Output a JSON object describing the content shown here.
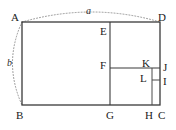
{
  "figure": {
    "canvas": {
      "width": 176,
      "height": 130
    },
    "colors": {
      "solid_stroke": "#3a3a3a",
      "inner_stroke": "#4a4a4a",
      "dotted_stroke": "#8a8a8a",
      "label_text": "#1a1a1a",
      "dimension_text": "#2b2b2b",
      "background": "#ffffff"
    },
    "outer_rectangle": {
      "name": "ABCD",
      "corners": {
        "A": [
          22,
          22
        ],
        "B": [
          22,
          105
        ],
        "C": [
          160,
          105
        ],
        "D": [
          160,
          22
        ]
      }
    },
    "points": {
      "A": [
        22,
        22
      ],
      "B": [
        22,
        105
      ],
      "C": [
        160,
        105
      ],
      "D": [
        160,
        22
      ],
      "E": [
        110,
        22
      ],
      "F": [
        110,
        68
      ],
      "G": [
        110,
        105
      ],
      "H": [
        152,
        105
      ],
      "I": [
        160,
        80
      ],
      "J": [
        160,
        68
      ],
      "K": [
        152,
        68
      ],
      "L": [
        152,
        80
      ]
    },
    "segments": [
      {
        "name": "AB",
        "from": "A",
        "to": "B",
        "style": "solid"
      },
      {
        "name": "BC",
        "from": "B",
        "to": "C",
        "style": "solid"
      },
      {
        "name": "CD",
        "from": "C",
        "to": "D",
        "style": "solid"
      },
      {
        "name": "DA",
        "from": "D",
        "to": "A",
        "style": "solid"
      },
      {
        "name": "EG",
        "from": "E",
        "to": "G",
        "style": "solid"
      },
      {
        "name": "FJ",
        "from": "F",
        "to": "J",
        "style": "solid"
      },
      {
        "name": "HK",
        "from": "H",
        "to": "K",
        "style": "solid"
      },
      {
        "name": "LI",
        "from": "L",
        "to": "I",
        "style": "solid"
      }
    ],
    "arcs": [
      {
        "name": "arc-a",
        "label": "a",
        "from": "A",
        "to": "D",
        "style": "dotted",
        "bulge": "up",
        "label_position": [
          88,
          10
        ]
      },
      {
        "name": "arc-b",
        "label": "b",
        "from": "A",
        "to": "B",
        "style": "dotted",
        "bulge": "left",
        "label_position": [
          9,
          62
        ]
      }
    ],
    "vertex_labels": [
      {
        "id": "A",
        "text": "A",
        "x": 11,
        "y": 12
      },
      {
        "id": "B",
        "text": "B",
        "x": 16,
        "y": 110
      },
      {
        "id": "C",
        "text": "C",
        "x": 158,
        "y": 110
      },
      {
        "id": "D",
        "text": "D",
        "x": 158,
        "y": 12
      },
      {
        "id": "E",
        "text": "E",
        "x": 100,
        "y": 26
      },
      {
        "id": "F",
        "text": "F",
        "x": 100,
        "y": 60
      },
      {
        "id": "G",
        "text": "G",
        "x": 106,
        "y": 110
      },
      {
        "id": "H",
        "text": "H",
        "x": 145,
        "y": 110
      },
      {
        "id": "I",
        "text": "I",
        "x": 163,
        "y": 76
      },
      {
        "id": "J",
        "text": "J",
        "x": 163,
        "y": 62
      },
      {
        "id": "K",
        "text": "K",
        "x": 142,
        "y": 58
      },
      {
        "id": "L",
        "text": "L",
        "x": 140,
        "y": 73
      }
    ],
    "dimension_labels": [
      {
        "id": "a",
        "text": "a",
        "x": 86,
        "y": 6
      },
      {
        "id": "b",
        "text": "b",
        "x": 7,
        "y": 58
      }
    ]
  }
}
